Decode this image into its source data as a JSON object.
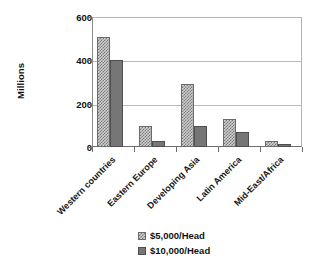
{
  "chart_data": {
    "type": "bar",
    "title": "",
    "xlabel": "",
    "ylabel": "Millions",
    "ylim": [
      0,
      600
    ],
    "yticks": [
      0,
      200,
      400,
      600
    ],
    "ytick_labels": [
      "0",
      "200",
      "400",
      "600"
    ],
    "grid": true,
    "legend_position": "bottom",
    "categories": [
      "Western countries",
      "Eastern Europe",
      "Developing Asia",
      "Latin America",
      "Mid-East/Africa"
    ],
    "series": [
      {
        "name": "$5,000/Head",
        "values": [
          510,
          95,
          290,
          130,
          30
        ],
        "color": "#cfcfcf",
        "pattern": "checker"
      },
      {
        "name": "$10,000/Head",
        "values": [
          400,
          30,
          95,
          70,
          13
        ],
        "color": "#767676",
        "pattern": "solid"
      }
    ]
  },
  "axis": {
    "y_title": "Millions"
  },
  "legend": {
    "items": [
      {
        "label": "$5,000/Head"
      },
      {
        "label": "$10,000/Head"
      }
    ]
  }
}
